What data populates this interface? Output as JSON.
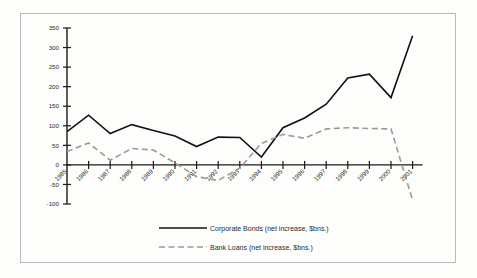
{
  "chart_data": {
    "type": "line",
    "title": "",
    "xlabel": "",
    "ylabel": "",
    "grid": false,
    "legend_position": "bottom-center",
    "ylim": [
      -100,
      350
    ],
    "yticks": [
      -100,
      -50,
      0,
      50,
      100,
      150,
      200,
      250,
      300,
      350
    ],
    "ytick_labels": [
      "-100",
      "-50",
      "0",
      "50",
      "100",
      "150",
      "200",
      "250",
      "300",
      "350"
    ],
    "categories": [
      "1985",
      "1986",
      "1987",
      "1988",
      "1989",
      "1990",
      "1991",
      "1992",
      "1993",
      "1994",
      "1995",
      "1996",
      "1997",
      "1998",
      "1999",
      "2000",
      "2001"
    ],
    "series": [
      {
        "name": "Corporate Bonds (net increase, $bns.)",
        "style": "solid",
        "color": "#121212",
        "values": [
          85,
          127,
          80,
          103,
          88,
          74,
          47,
          71,
          70,
          20,
          95,
          120,
          155,
          222,
          232,
          172,
          330
        ]
      },
      {
        "name": "Bank Loans (net increase, $bns.)",
        "style": "dashed",
        "color": "#9a9a9a",
        "values": [
          34,
          56,
          12,
          42,
          38,
          5,
          -30,
          -40,
          -8,
          55,
          78,
          68,
          92,
          95,
          93,
          92,
          -90
        ]
      }
    ]
  },
  "legend": {
    "items": [
      {
        "label": "Corporate Bonds (net increase, $bns.)",
        "style": "solid"
      },
      {
        "label": "Bank Loans (net increase, $bns.)",
        "style": "dashed"
      }
    ]
  }
}
